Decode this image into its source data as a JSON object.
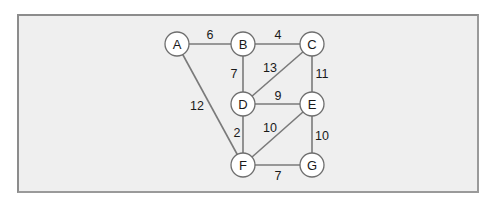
{
  "diagram": {
    "type": "weighted-undirected-graph",
    "colors": {
      "background": "#ffffff",
      "panel": "#efefef",
      "border": "#8c8c8c",
      "edge": "#7a7a7a",
      "node_fill": "#ffffff",
      "text": "#1a1a1a"
    },
    "nodes": [
      {
        "id": "A",
        "label": "A",
        "x": 177,
        "y": 44
      },
      {
        "id": "B",
        "label": "B",
        "x": 243,
        "y": 44
      },
      {
        "id": "C",
        "label": "C",
        "x": 312,
        "y": 44
      },
      {
        "id": "D",
        "label": "D",
        "x": 243,
        "y": 104
      },
      {
        "id": "E",
        "label": "E",
        "x": 312,
        "y": 104
      },
      {
        "id": "F",
        "label": "F",
        "x": 243,
        "y": 165
      },
      {
        "id": "G",
        "label": "G",
        "x": 312,
        "y": 165
      }
    ],
    "edges": [
      {
        "from": "A",
        "to": "B",
        "weight": "6",
        "lx": 210,
        "ly": 35
      },
      {
        "from": "B",
        "to": "C",
        "weight": "4",
        "lx": 278,
        "ly": 35
      },
      {
        "from": "B",
        "to": "D",
        "weight": "7",
        "lx": 234,
        "ly": 74
      },
      {
        "from": "C",
        "to": "D",
        "weight": "13",
        "lx": 270,
        "ly": 68
      },
      {
        "from": "C",
        "to": "E",
        "weight": "11",
        "lx": 322,
        "ly": 74
      },
      {
        "from": "A",
        "to": "F",
        "weight": "12",
        "lx": 197,
        "ly": 106
      },
      {
        "from": "D",
        "to": "E",
        "weight": "9",
        "lx": 278,
        "ly": 96
      },
      {
        "from": "D",
        "to": "F",
        "weight": "2",
        "lx": 237,
        "ly": 133
      },
      {
        "from": "E",
        "to": "F",
        "weight": "10",
        "lx": 270,
        "ly": 128
      },
      {
        "from": "E",
        "to": "G",
        "weight": "10",
        "lx": 322,
        "ly": 136
      },
      {
        "from": "F",
        "to": "G",
        "weight": "7",
        "lx": 278,
        "ly": 176
      }
    ]
  }
}
